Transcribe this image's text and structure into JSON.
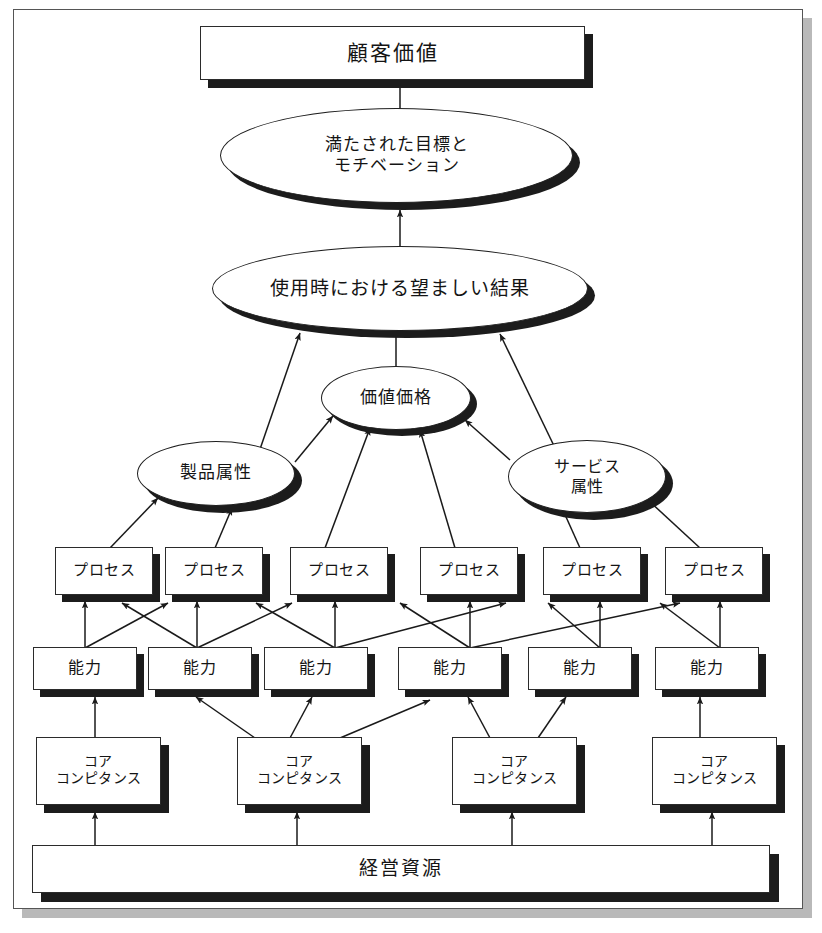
{
  "diagram": {
    "title_text": "顧客価値",
    "levels": {
      "customer_value": {
        "label": "顧客価値"
      },
      "goals": {
        "line1": "満たされた目標と",
        "line2": "モチベーション"
      },
      "outcomes": {
        "label": "使用時における望ましい結果"
      },
      "value_price": {
        "label": "価値価格"
      },
      "product_attributes": {
        "label": "製品属性"
      },
      "service_attributes": {
        "line1": "サービス",
        "line2": "属性"
      },
      "management_resources": {
        "label": "経営資源"
      }
    },
    "process_boxes": [
      {
        "label": "プロセス"
      },
      {
        "label": "プロセス"
      },
      {
        "label": "プロセス"
      },
      {
        "label": "プロセス"
      },
      {
        "label": "プロセス"
      },
      {
        "label": "プロセス"
      }
    ],
    "capability_boxes": [
      {
        "label": "能力"
      },
      {
        "label": "能力"
      },
      {
        "label": "能力"
      },
      {
        "label": "能力"
      },
      {
        "label": "能力"
      },
      {
        "label": "能力"
      }
    ],
    "core_competence_boxes": [
      {
        "line1": "コア",
        "line2": "コンピタンス"
      },
      {
        "line1": "コア",
        "line2": "コンピタンス"
      },
      {
        "line1": "コア",
        "line2": "コンピタンス"
      },
      {
        "line1": "コア",
        "line2": "コンピタンス"
      }
    ],
    "colors": {
      "page_background": "#ffffff",
      "frame_border": "#555555",
      "frame_shadow": "#b9b9b9",
      "node_fill": "#ffffff",
      "node_border": "#2b2b2b",
      "node_shadow": "#1c1c1c",
      "connector": "#1a1a1a",
      "text": "#141414"
    }
  }
}
